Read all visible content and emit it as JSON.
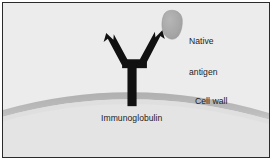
{
  "figure": {
    "background_color": "#ececec",
    "border_color": "#2b2b2b",
    "labels": {
      "native_antigen": "Native\nantigen",
      "native_antigen_line1": "Native",
      "native_antigen_line2": "antigen",
      "cell_wall": "Cell wall",
      "immunoglobulin": "Immunoglobulin"
    },
    "elements": {
      "antibody": {
        "name": "immunoglobulin-antibody",
        "shape": "Y",
        "color": "#111111"
      },
      "antigen": {
        "name": "native-antigen-blob",
        "shape": "rounded-blob",
        "fill_color": "#a8a8a8",
        "edge_color": "#9a9a9a"
      },
      "cell_wall": {
        "name": "cell-wall-arc",
        "shape": "arc",
        "band_color": "#b4b4b4",
        "interior_color": "#e2e2e2"
      }
    },
    "text_color": "#1c1c1c"
  }
}
